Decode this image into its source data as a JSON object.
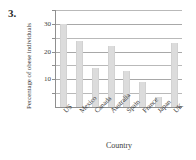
{
  "question": {
    "number": "3."
  },
  "chart_data": {
    "type": "bar",
    "title": "",
    "xlabel": "Country",
    "ylabel": "Percentage of obese individuals",
    "categories": [
      "US",
      "Mexico",
      "Canada",
      "Australia",
      "Spain",
      "France",
      "Japan",
      "UK"
    ],
    "values": [
      30,
      24,
      14,
      22,
      13,
      9,
      3.5,
      23
    ],
    "ylim": [
      0,
      35
    ],
    "yticks": [
      10,
      20,
      30
    ],
    "ytick_labels": [
      "10",
      "20",
      "30"
    ],
    "minor_gridlines": [
      5,
      15,
      25,
      35
    ],
    "grid": true,
    "legend": false,
    "bar_color": "#dcdcdc",
    "grid_color": "#b9b9b9",
    "axis_color": "#8f8f8f",
    "text_color": "#3d3d3d"
  }
}
